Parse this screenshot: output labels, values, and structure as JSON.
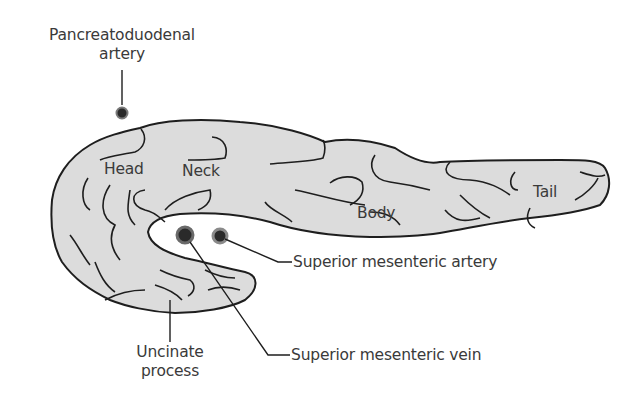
{
  "diagram": {
    "colors": {
      "organ_fill": "#dcdcdc",
      "outline": "#1e1e1e",
      "text": "#3a3a3a",
      "vessel_dark": "#2a2a2a",
      "vessel_ring": "#7a7a7a"
    },
    "region_labels": {
      "head": "Head",
      "neck": "Neck",
      "body": "Body",
      "tail": "Tail"
    },
    "callouts": {
      "pancreatoduodenal_line1": "Pancreatoduodenal",
      "pancreatoduodenal_line2": "artery",
      "sma": "Superior mesenteric artery",
      "smv": "Superior mesenteric vein",
      "uncinate_line1": "Uncinate",
      "uncinate_line2": "process"
    }
  }
}
